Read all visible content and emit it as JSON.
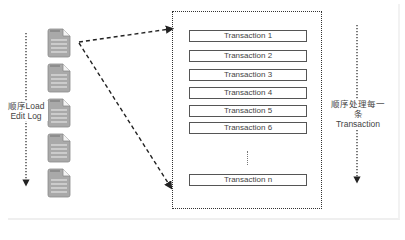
{
  "diagram": {
    "left_label": {
      "line1": "顺序Load",
      "line2": "Edit Log"
    },
    "right_label": {
      "line1": "顺序处理每一条",
      "line2": "Transaction"
    },
    "edit_log_files": [
      {
        "icon": "document-icon"
      },
      {
        "icon": "document-icon"
      },
      {
        "icon": "document-icon"
      },
      {
        "icon": "document-icon"
      },
      {
        "icon": "document-icon"
      }
    ],
    "transactions": [
      {
        "label": "Transaction 1"
      },
      {
        "label": "Transaction 2"
      },
      {
        "label": "Transaction 3"
      },
      {
        "label": "Transaction 4"
      },
      {
        "label": "Transaction 5"
      },
      {
        "label": "Transaction 6"
      }
    ],
    "ellipsis": "⋮",
    "last_transaction": {
      "label": "Transaction n"
    },
    "colors": {
      "document_fill": "#a9a9a9",
      "document_stroke": "#8a8a8a",
      "arrow": "#222222",
      "box_border": "#555555",
      "text": "#444444"
    }
  }
}
